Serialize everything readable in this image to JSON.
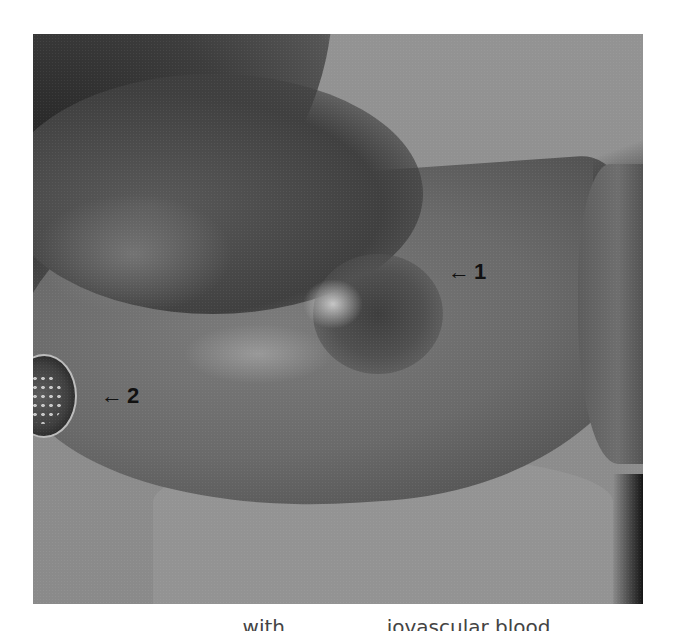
{
  "figure": {
    "type": "clinical-photograph",
    "color_mode": "grayscale",
    "annotations": [
      {
        "id": "1",
        "arrow": "←",
        "number": "1"
      },
      {
        "id": "2",
        "arrow": "←",
        "number": "2"
      }
    ],
    "caption_partial": "...with ... ... ... ...iovascular blood"
  },
  "colors": {
    "page_background": "#ffffff",
    "label_text": "#111111",
    "caption_text": "#444444"
  }
}
